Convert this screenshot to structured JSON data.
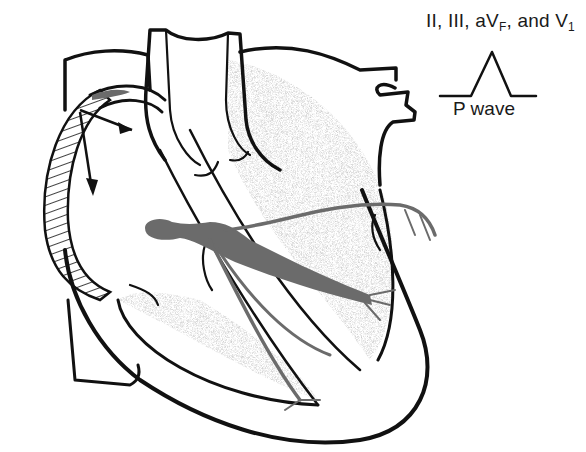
{
  "figure": {
    "type": "anatomical-diagram",
    "colors": {
      "outline": "#111111",
      "conduction_pathway": "#6b6b6b",
      "background": "#ffffff",
      "stipple": "#9a9a9a"
    }
  },
  "labels": {
    "lead_prefix": "II, III, aV",
    "lead_sub_f": "F",
    "lead_mid": ", and V",
    "lead_sub_1": "1",
    "waveform": "P wave"
  },
  "annotations": {
    "arrows": [
      {
        "name": "depolarization-arrow-right",
        "direction": "right"
      },
      {
        "name": "depolarization-arrow-down",
        "direction": "down"
      }
    ],
    "hatched_region": "right atrium (depolarized)"
  }
}
